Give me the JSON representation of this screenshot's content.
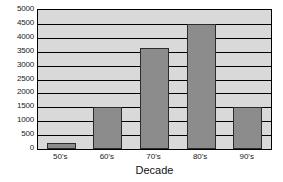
{
  "chart_data": {
    "type": "bar",
    "title": "",
    "xlabel": "Decade",
    "ylabel": "",
    "categories": [
      "50's",
      "60's",
      "70's",
      "80's",
      "90's"
    ],
    "values": [
      200,
      1500,
      3650,
      4500,
      1500
    ],
    "ylim": [
      0,
      5000
    ],
    "ytick_step": 500,
    "yticks": [
      5000,
      4500,
      4000,
      3500,
      3000,
      2500,
      2000,
      1500,
      1000,
      500,
      0
    ],
    "grid": true,
    "legend": "none",
    "colors": {
      "bar_fill": "#8c8c8c",
      "bar_border": "#2b2b2b",
      "plot_background": "#d9d9d9",
      "gridline": "#000000",
      "frame": "#000000",
      "text": "#1a1a1a",
      "page_background": "#ffffff"
    }
  }
}
